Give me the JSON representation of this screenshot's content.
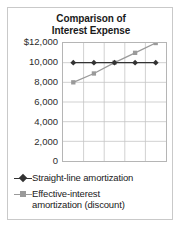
{
  "chart_data": {
    "type": "line",
    "title": "Comparison of Interest Expense",
    "title_lines": [
      "Comparison of",
      "Interest Expense"
    ],
    "xlabel": "",
    "ylabel": "",
    "ylim": [
      0,
      12000
    ],
    "ytick_labels": [
      "$12,000",
      "10,000",
      "8,000",
      "6,000",
      "4,000",
      "2,000",
      "0"
    ],
    "ytick_values": [
      12000,
      10000,
      8000,
      6000,
      4000,
      2000,
      0
    ],
    "x": [
      1,
      2,
      3,
      4,
      5
    ],
    "grid": true,
    "legend_position": "below",
    "series": [
      {
        "name": "Straight-line amortization",
        "label_lines": [
          "Straight-line amortization"
        ],
        "values": [
          10000,
          10000,
          10000,
          10000,
          10000
        ],
        "color": "#333333",
        "marker": "diamond"
      },
      {
        "name": "Effective-interest amortization (discount)",
        "label_lines": [
          "Effective-interest",
          "amortization (discount)"
        ],
        "values": [
          8000,
          8900,
          10000,
          11000,
          12000
        ],
        "color": "#9a9a9a",
        "marker": "square"
      }
    ]
  },
  "colors": {
    "card_border": "#c9c9c9",
    "plot_border": "#b5b5b5",
    "grid": "#c4c4c4",
    "text": "#1a1a1a",
    "background": "#ffffff"
  }
}
